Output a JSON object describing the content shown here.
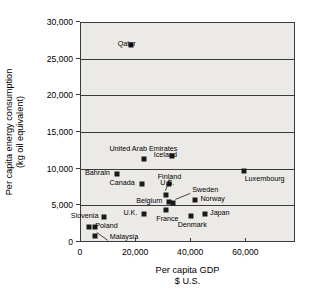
{
  "chart_data": {
    "type": "scatter",
    "title": "",
    "xlabel": "Per capita GDP",
    "xlabel_line2": "$ U.S.",
    "ylabel": "Per capita energy consumption",
    "ylabel_line2": "(kg oil equivalent)",
    "xlim": [
      0,
      78000
    ],
    "ylim": [
      0,
      30000
    ],
    "xticks": [
      0,
      20000,
      40000,
      60000
    ],
    "xtick_labels": [
      "0",
      "20,000",
      "40,000",
      "60,000"
    ],
    "yticks": [
      0,
      5000,
      10000,
      15000,
      20000,
      25000,
      30000
    ],
    "ytick_labels": [
      "0",
      "5,000",
      "10,000",
      "15,000",
      "20,000",
      "25,000",
      "30,000"
    ],
    "grid": true,
    "grid_axis": "y",
    "legend": "none",
    "marker_color": "#1a1a1a",
    "plot_background": "#eceae7",
    "points": [
      {
        "name": "Qatar",
        "x": 18000,
        "y": 27000,
        "label_side": "right",
        "label_dx": 6,
        "label_dy": 0,
        "leader": false
      },
      {
        "name": "Iceland",
        "x": 33000,
        "y": 11800,
        "label_side": "right",
        "label_dx": 6,
        "label_dy": 0,
        "leader": false
      },
      {
        "name": "United Arab Emirates",
        "x": 23000,
        "y": 11400,
        "label_side": "mid",
        "label_dx": 0,
        "label_dy": -9,
        "leader": false
      },
      {
        "name": "Luxembourg",
        "x": 59000,
        "y": 9800,
        "label_side": "left",
        "label_dx": 2,
        "label_dy": 9,
        "leader": false
      },
      {
        "name": "Bahrain",
        "x": 13000,
        "y": 9400,
        "label_side": "right",
        "label_dx": -6,
        "label_dy": 0,
        "leader": false
      },
      {
        "name": "Canada",
        "x": 22000,
        "y": 8000,
        "label_side": "right",
        "label_dx": -6,
        "label_dy": 0,
        "leader": false
      },
      {
        "name": "U.S.",
        "x": 32000,
        "y": 8000,
        "label_side": "right",
        "label_dx": 6,
        "label_dy": 0,
        "leader": false
      },
      {
        "name": "Finland",
        "x": 31000,
        "y": 6600,
        "label_side": "mid",
        "label_dx": 4,
        "label_dy": -17,
        "leader": true
      },
      {
        "name": "Belgium",
        "x": 32000,
        "y": 5600,
        "label_side": "right",
        "label_dx": -6,
        "label_dy": 0,
        "leader": false
      },
      {
        "name": "Sweden",
        "x": 33500,
        "y": 5400,
        "label_side": "left",
        "label_dx": 20,
        "label_dy": -12,
        "leader": true
      },
      {
        "name": "Norway",
        "x": 41500,
        "y": 5900,
        "label_side": "left",
        "label_dx": 6,
        "label_dy": 0,
        "leader": false
      },
      {
        "name": "France",
        "x": 31000,
        "y": 4500,
        "label_side": "mid",
        "label_dx": 2,
        "label_dy": 10,
        "leader": false
      },
      {
        "name": "U.K.",
        "x": 23000,
        "y": 4000,
        "label_side": "right",
        "label_dx": -6,
        "label_dy": 0,
        "leader": false
      },
      {
        "name": "Japan",
        "x": 45000,
        "y": 4000,
        "label_side": "left",
        "label_dx": 6,
        "label_dy": 0,
        "leader": false
      },
      {
        "name": "Denmark",
        "x": 40000,
        "y": 3700,
        "label_side": "mid",
        "label_dx": 2,
        "label_dy": 10,
        "leader": false
      },
      {
        "name": "Slovenia",
        "x": 8500,
        "y": 3500,
        "label_side": "right",
        "label_dx": -5,
        "label_dy": 0,
        "leader": false
      },
      {
        "name": "Poland",
        "x": 3000,
        "y": 2200,
        "label_side": "left",
        "label_dx": 7,
        "label_dy": 0,
        "leader": false
      },
      {
        "name": "Malaysia",
        "x": 5000,
        "y": 900,
        "label_side": "left",
        "label_dx": 16,
        "label_dy": 2,
        "leader": true
      }
    ],
    "extra_markers": [
      {
        "name": "poland-pair-marker",
        "x": 5200,
        "y": 2200
      }
    ]
  }
}
